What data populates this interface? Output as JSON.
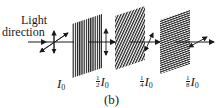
{
  "diagram": {
    "caption": "(b)",
    "light_label": {
      "line1": "Light",
      "line2": "direction"
    },
    "intensity_labels": [
      {
        "fraction_num": "",
        "fraction_den": "",
        "symbol": "I",
        "subscript": "0"
      },
      {
        "fraction_num": "1",
        "fraction_den": "2",
        "symbol": "I",
        "subscript": "0"
      },
      {
        "fraction_num": "1",
        "fraction_den": "4",
        "symbol": "I",
        "subscript": "0"
      },
      {
        "fraction_num": "1",
        "fraction_den": "8",
        "symbol": "I",
        "subscript": "0"
      }
    ],
    "polarizers": [
      {
        "name": "polarizer-1",
        "stripe_orientation": "vertical"
      },
      {
        "name": "polarizer-2",
        "stripe_orientation": "diagonal"
      },
      {
        "name": "polarizer-3",
        "stripe_orientation": "horizontal"
      }
    ],
    "colors": {
      "ink": "#1a1a1a",
      "background": "#ffffff"
    }
  }
}
